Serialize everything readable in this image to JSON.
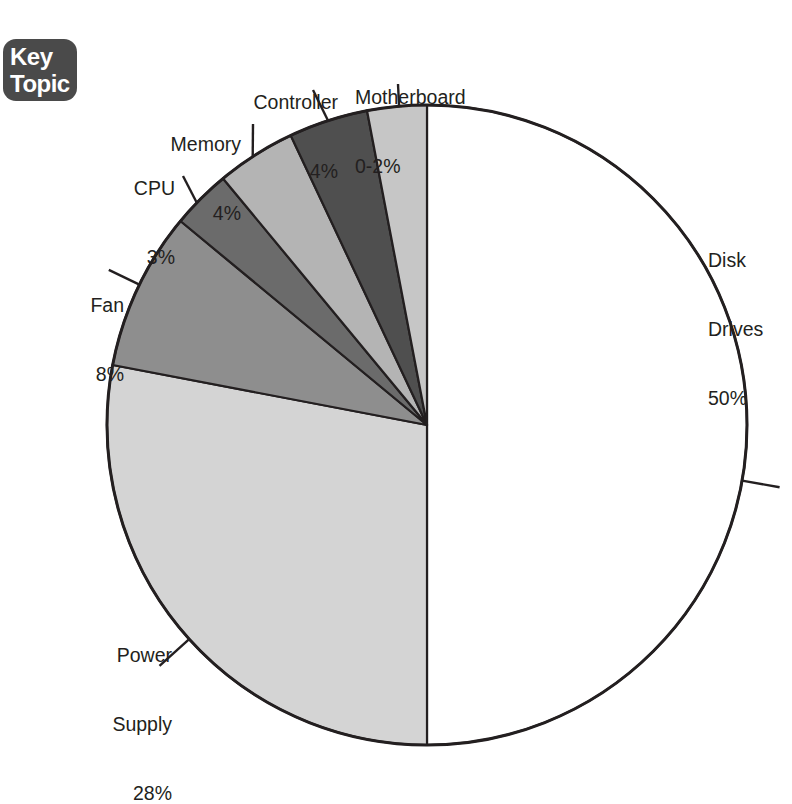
{
  "badge": {
    "name": "key-topic-badge",
    "line1": "Key",
    "line2": "Topic",
    "background": "#4a4a4a",
    "text_color": "#ffffff"
  },
  "chart_data": {
    "type": "pie",
    "title": "",
    "subtitle": "",
    "xlabel": "",
    "ylabel": "",
    "grid": false,
    "legend_position": "callout-labels",
    "start_angle_deg": 0,
    "direction": "clockwise",
    "center": {
      "x": 427,
      "y": 425
    },
    "radius": 320,
    "categories": [
      "Disk Drives",
      "Power Supply",
      "Fan",
      "CPU",
      "Memory",
      "Controller",
      "Motherboard"
    ],
    "values": [
      50,
      28,
      8,
      3,
      4,
      4,
      2
    ],
    "value_labels": [
      "50%",
      "28%",
      "8%",
      "3%",
      "4%",
      "4%",
      "0-2%"
    ],
    "colors": [
      "#ffffff",
      "#d4d4d4",
      "#8e8e8e",
      "#6b6b6b",
      "#b4b4b4",
      "#4f4f4f",
      "#c6c6c6"
    ],
    "slices": [
      {
        "label": "Disk Drives",
        "value": 50,
        "value_label": "50%",
        "color": "#ffffff",
        "start_deg": 0,
        "end_deg": 180
      },
      {
        "label": "Power Supply",
        "value": 28,
        "value_label": "28%",
        "color": "#d4d4d4",
        "start_deg": 180,
        "end_deg": 280.8
      },
      {
        "label": "Fan",
        "value": 8,
        "value_label": "8%",
        "color": "#8e8e8e",
        "start_deg": 280.8,
        "end_deg": 309.6
      },
      {
        "label": "CPU",
        "value": 3,
        "value_label": "3%",
        "color": "#6b6b6b",
        "start_deg": 309.6,
        "end_deg": 320.4
      },
      {
        "label": "Memory",
        "value": 4,
        "value_label": "4%",
        "color": "#b4b4b4",
        "start_deg": 320.4,
        "end_deg": 334.8
      },
      {
        "label": "Controller",
        "value": 4,
        "value_label": "4%",
        "color": "#4f4f4f",
        "start_deg": 334.8,
        "end_deg": 349.2
      },
      {
        "label": "Motherboard",
        "value": 2,
        "value_label": "0-2%",
        "color": "#c6c6c6",
        "start_deg": 349.2,
        "end_deg": 360
      }
    ],
    "outline_color": "#231f20",
    "outline_width": 3,
    "divider_color": "#231f20",
    "divider_width": 2.2,
    "leader_color": "#231f20",
    "leader_width": 2.4
  },
  "labels": {
    "disk_drives": {
      "name": "Disk",
      "name2": "Drives",
      "value": "50%"
    },
    "power_supply": {
      "name": "Power",
      "name2": "Supply",
      "value": "28%"
    },
    "fan": {
      "name": "Fan",
      "value": "8%"
    },
    "cpu": {
      "name": "CPU",
      "value": "3%"
    },
    "memory": {
      "name": "Memory",
      "value": "4%"
    },
    "controller": {
      "name": "Controller",
      "value": "4%"
    },
    "motherboard": {
      "name": "Motherboard",
      "value": "0-2%"
    }
  }
}
